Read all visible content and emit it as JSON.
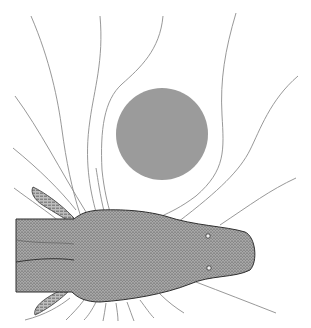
{
  "illustration": {
    "subject": "electric fish sensing an object",
    "description": "Top-down drawing of a fish head with electric field lines bending around a round grey object",
    "colors": {
      "background": "#ffffff",
      "object": "#9b9b9b",
      "field_lines": "#8c8c8c",
      "fish_body": "#8a8a8a",
      "fish_outline": "#333333"
    },
    "object": {
      "shape": "circle",
      "cx": 162,
      "cy": 134,
      "r": 46
    },
    "fish": {
      "head_tip_x": 255,
      "body_top_y": 210,
      "body_bottom_y": 302,
      "eye_count": 2
    }
  }
}
